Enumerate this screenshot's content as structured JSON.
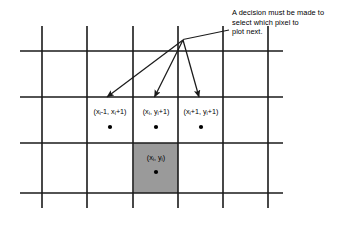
{
  "figure": {
    "background_color": "#ffffff",
    "line_color": "#1a1a1a",
    "shaded_cell_color": "#9a9a9a",
    "annotation": {
      "text": "A decision must be made to select which pixel to plot next.",
      "line1": "A decision must be made to",
      "line2": "select which pixel to",
      "line3": "plot next."
    },
    "labels": [
      {
        "id": "left-candidate",
        "text": "(xi-1, xi+1)",
        "prefix": "(x",
        "sub1": "i",
        "mid": "-1, x",
        "sub2": "i",
        "suffix": "+1)",
        "x": 110,
        "y": 114
      },
      {
        "id": "center-candidate",
        "text": "(xi, yi+1)",
        "prefix": "(x",
        "sub1": "i",
        "mid": ", y",
        "sub2": "i",
        "suffix": "+1)",
        "x": 156,
        "y": 114
      },
      {
        "id": "right-candidate",
        "text": "(xi+1, yi+1)",
        "prefix": "(x",
        "sub1": "i",
        "mid": "+1, y",
        "sub2": "i",
        "suffix": "+1)",
        "x": 201,
        "y": 114
      },
      {
        "id": "current-pixel",
        "text": "(xi, yi)",
        "prefix": "(x",
        "sub1": "i",
        "mid": ", y",
        "sub2": "i",
        "suffix": ")",
        "x": 156,
        "y": 160
      }
    ],
    "grid": {
      "vertical_lines_x": [
        42,
        87,
        133,
        178,
        223,
        268
      ],
      "vertical_span_y": [
        26,
        208
      ],
      "horizontal_lines_y": [
        51,
        97,
        143,
        193
      ],
      "horizontal_span_x": [
        20,
        283
      ]
    },
    "shaded_cell": {
      "x": 133,
      "y": 143,
      "width": 45,
      "height": 50
    },
    "dots": [
      {
        "id": "dot-left",
        "x": 110,
        "y": 127
      },
      {
        "id": "dot-center",
        "x": 156,
        "y": 127
      },
      {
        "id": "dot-right",
        "x": 201,
        "y": 127
      },
      {
        "id": "dot-current",
        "x": 156,
        "y": 172
      }
    ],
    "arrows": [
      {
        "id": "arrow-to-left-candidate",
        "from_x": 183,
        "from_y": 40,
        "to_x": 106,
        "to_y": 98
      },
      {
        "id": "arrow-to-center-candidate",
        "from_x": 183,
        "from_y": 40,
        "to_x": 154,
        "to_y": 98
      },
      {
        "id": "arrow-to-right-candidate",
        "from_x": 183,
        "from_y": 40,
        "to_x": 199,
        "to_y": 98
      }
    ],
    "leader_line": {
      "from_x": 183,
      "from_y": 39,
      "to_x": 229,
      "to_y": 30
    }
  }
}
